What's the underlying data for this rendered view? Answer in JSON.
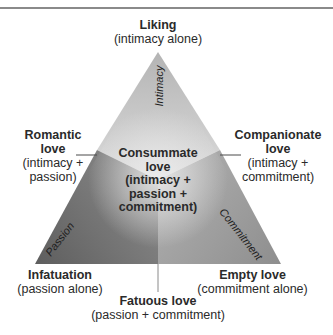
{
  "diagram": {
    "type": "triangular-theory-of-love",
    "colors": {
      "intimacy_region": "#c4c4c4",
      "passion_region": "#6a6a6a",
      "commitment_region": "#9a9a9a",
      "center_highlight": "#e2e2e2",
      "rule": "#8a8a8a",
      "connector": "#4a4a4a"
    },
    "edges": {
      "intimacy": "Intimacy",
      "passion": "Passion",
      "commitment": "Commitment"
    },
    "vertices": {
      "top": {
        "title": "Liking",
        "subtitle": "(intimacy alone)"
      },
      "bottom_left": {
        "title": "Infatuation",
        "subtitle": "(passion alone)"
      },
      "bottom_right": {
        "title": "Empty love",
        "subtitle": "(commitment alone)"
      }
    },
    "sides": {
      "left": {
        "title_1": "Romantic",
        "title_2": "love",
        "sub_1": "(intimacy +",
        "sub_2": "passion)"
      },
      "right": {
        "title_1": "Companionate",
        "title_2": "love",
        "sub_1": "(intimacy +",
        "sub_2": "commitment)"
      },
      "bottom": {
        "title": "Fatuous love",
        "subtitle": "(passion + commitment)"
      }
    },
    "center": {
      "line_1": "Consummate",
      "line_2": "love",
      "line_3": "(intimacy +",
      "line_4": "passion +",
      "line_5": "commitment)"
    }
  }
}
